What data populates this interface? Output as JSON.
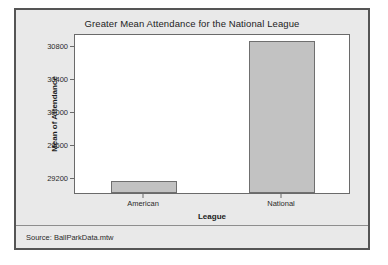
{
  "chart_data": {
    "type": "bar",
    "title": "Greater Mean Attendance for the National League",
    "xlabel": "League",
    "ylabel": "Mean of Attendance",
    "categories": [
      "American",
      "National"
    ],
    "values": [
      29150,
      30850
    ],
    "ylim": [
      29000,
      30950
    ],
    "yticks": [
      29200,
      29600,
      30000,
      30400,
      30800
    ],
    "ytick_labels": [
      "29200",
      "29600",
      "30000",
      "30400",
      "30800"
    ],
    "grid": false,
    "legend": "none",
    "bar_color": "#c2c2c2",
    "bar_edge_color": "#6f6f6f",
    "panel_color": "#e9e9e9",
    "plot_bg_color": "#ffffff"
  },
  "footer": {
    "source": "Source: BallParkData.mtw"
  }
}
